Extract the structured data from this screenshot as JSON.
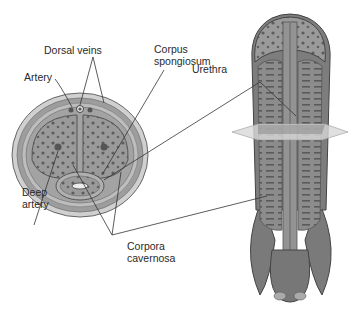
{
  "diagram": {
    "labels": {
      "dorsal_veins": "Dorsal veins",
      "artery": "Artery",
      "corpus_spongiosum_line1": "Corpus",
      "corpus_spongiosum_line2": "spongiosum",
      "urethra": "Urethra",
      "deep_artery_line1": "Deep",
      "deep_artery_line2": "artery",
      "corpora_cavernosa_line1": "Corpora",
      "corpora_cavernosa_line2": "cavernosa"
    },
    "colors": {
      "tissue_dark": "#5f5f5f",
      "tissue_mid": "#8a8a8a",
      "tissue_light": "#b5b5b5",
      "outer_skin": "#c9c9c9",
      "plane": "#d8d8d8",
      "leader_line": "#333333",
      "text": "#2a2a2a"
    }
  }
}
